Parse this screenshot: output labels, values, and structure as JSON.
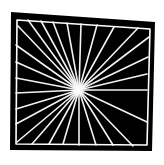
{
  "figure": {
    "canvas": {
      "width": 164,
      "height": 165
    },
    "colors": {
      "page_background": "#ffffff",
      "shape_fill": "#000000",
      "ray_stroke": "#f2f2f2",
      "outline_stroke": "#ffffff",
      "center_glow": "#ffffff"
    },
    "shape": {
      "name": "black-quadrilateral",
      "points": [
        {
          "x": 11,
          "y": 12
        },
        {
          "x": 155,
          "y": 22
        },
        {
          "x": 152,
          "y": 151
        },
        {
          "x": 10,
          "y": 150
        }
      ],
      "inner_outline_points": [
        {
          "x": 17,
          "y": 20
        },
        {
          "x": 150,
          "y": 29
        },
        {
          "x": 147,
          "y": 145
        },
        {
          "x": 16,
          "y": 144
        }
      ]
    },
    "center": {
      "x": 79,
      "y": 90,
      "glow_radius": 7
    },
    "ray_count": 28,
    "ray_stroke_width": 1.6,
    "rays": [
      {
        "id": 1,
        "angle_deg": 0,
        "end_x": 147,
        "end_y": 90
      },
      {
        "id": 2,
        "angle_deg": 13,
        "end_x": 147,
        "end_y": 74
      },
      {
        "id": 3,
        "angle_deg": 26,
        "end_x": 148,
        "end_y": 57
      },
      {
        "id": 4,
        "angle_deg": 40,
        "end_x": 149,
        "end_y": 37
      },
      {
        "id": 5,
        "angle_deg": 52,
        "end_x": 138,
        "end_y": 28
      },
      {
        "id": 6,
        "angle_deg": 63,
        "end_x": 114,
        "end_y": 27
      },
      {
        "id": 7,
        "angle_deg": 75,
        "end_x": 97,
        "end_y": 25
      },
      {
        "id": 8,
        "angle_deg": 88,
        "end_x": 81,
        "end_y": 24
      },
      {
        "id": 9,
        "angle_deg": 100,
        "end_x": 67,
        "end_y": 23
      },
      {
        "id": 10,
        "angle_deg": 112,
        "end_x": 53,
        "end_y": 22
      },
      {
        "id": 11,
        "angle_deg": 124,
        "end_x": 41,
        "end_y": 21
      },
      {
        "id": 12,
        "angle_deg": 136,
        "end_x": 28,
        "end_y": 20
      },
      {
        "id": 13,
        "angle_deg": 149,
        "end_x": 18,
        "end_y": 26
      },
      {
        "id": 14,
        "angle_deg": 161,
        "end_x": 16,
        "end_y": 45
      },
      {
        "id": 15,
        "angle_deg": 172,
        "end_x": 16,
        "end_y": 62
      },
      {
        "id": 16,
        "angle_deg": 180,
        "end_x": 16,
        "end_y": 78
      },
      {
        "id": 17,
        "angle_deg": 189,
        "end_x": 16,
        "end_y": 93
      },
      {
        "id": 18,
        "angle_deg": 198,
        "end_x": 16,
        "end_y": 109
      },
      {
        "id": 19,
        "angle_deg": 208,
        "end_x": 16,
        "end_y": 124
      },
      {
        "id": 20,
        "angle_deg": 219,
        "end_x": 17,
        "end_y": 142
      },
      {
        "id": 21,
        "angle_deg": 232,
        "end_x": 32,
        "end_y": 144
      },
      {
        "id": 22,
        "angle_deg": 244,
        "end_x": 49,
        "end_y": 144
      },
      {
        "id": 23,
        "angle_deg": 256,
        "end_x": 63,
        "end_y": 144
      },
      {
        "id": 24,
        "angle_deg": 268,
        "end_x": 79,
        "end_y": 145
      },
      {
        "id": 25,
        "angle_deg": 281,
        "end_x": 96,
        "end_y": 145
      },
      {
        "id": 26,
        "angle_deg": 295,
        "end_x": 113,
        "end_y": 145
      },
      {
        "id": 27,
        "angle_deg": 312,
        "end_x": 133,
        "end_y": 146
      },
      {
        "id": 28,
        "angle_deg": 335,
        "end_x": 147,
        "end_y": 122
      }
    ]
  }
}
